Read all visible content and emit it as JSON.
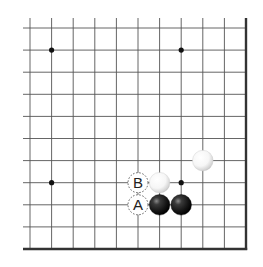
{
  "board": {
    "region": "lower-right corner",
    "columns": 11,
    "rows": 11,
    "origin": {
      "x": 30,
      "y": 28
    },
    "spacing": {
      "x": 21.6,
      "y": 22.1
    },
    "line_color": "#555555",
    "edge_color": "#333333",
    "background": "#ffffff",
    "edges": {
      "right": true,
      "bottom": true,
      "left": false,
      "top": false
    }
  },
  "star_points": [
    {
      "col": 1,
      "row": 1
    },
    {
      "col": 7,
      "row": 1
    },
    {
      "col": 1,
      "row": 7
    },
    {
      "col": 7,
      "row": 7
    }
  ],
  "stones": [
    {
      "color": "white",
      "col": 8,
      "row": 6
    },
    {
      "color": "white",
      "col": 6,
      "row": 7
    },
    {
      "color": "black",
      "col": 6,
      "row": 8
    },
    {
      "color": "black",
      "col": 7,
      "row": 8
    }
  ],
  "labels": [
    {
      "text": "B",
      "col": 5,
      "row": 7
    },
    {
      "text": "A",
      "col": 5,
      "row": 8
    }
  ]
}
